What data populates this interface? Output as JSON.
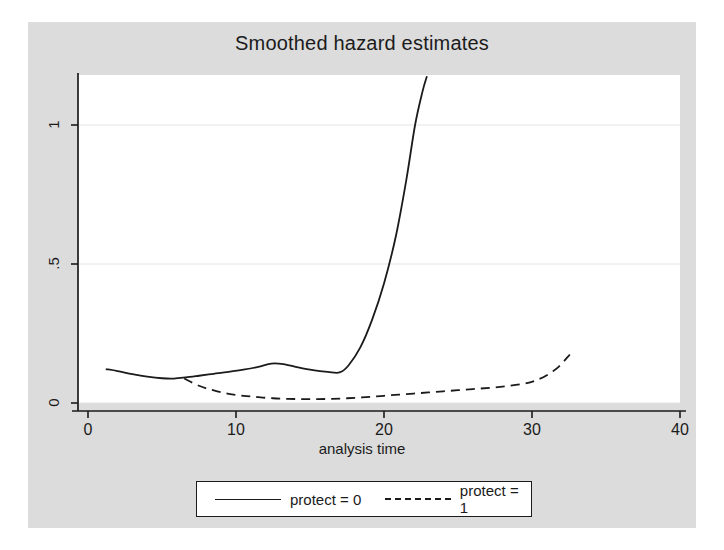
{
  "chart_data": {
    "type": "line",
    "title": "Smoothed hazard estimates",
    "xlabel": "analysis time",
    "ylabel": "",
    "xlim": [
      0,
      40
    ],
    "ylim": [
      0,
      1.22
    ],
    "xticks": [
      "0",
      "10",
      "20",
      "30",
      "40"
    ],
    "xtick_values": [
      0,
      10,
      20,
      30,
      40
    ],
    "yticks": [
      "0",
      ".5",
      "1"
    ],
    "ytick_values": [
      0,
      0.5,
      1
    ],
    "grid": "horizontal",
    "legend_position": "below-axes",
    "series": [
      {
        "name": "protect = 0",
        "style": "solid",
        "color": "#1b1b1b",
        "x": [
          1.2,
          2.0,
          3.0,
          4.0,
          5.0,
          5.8,
          6.6,
          7.5,
          8.5,
          9.5,
          10.5,
          11.5,
          12.4,
          13.2,
          14.2,
          15.2,
          16.2,
          17.0,
          17.6,
          18.4,
          19.2,
          20.0,
          20.8,
          21.5,
          22.1,
          22.6,
          22.9
        ],
        "y": [
          0.122,
          0.115,
          0.104,
          0.095,
          0.089,
          0.088,
          0.092,
          0.098,
          0.105,
          0.112,
          0.12,
          0.13,
          0.142,
          0.14,
          0.128,
          0.118,
          0.112,
          0.11,
          0.135,
          0.2,
          0.3,
          0.43,
          0.6,
          0.8,
          1.0,
          1.12,
          1.175
        ]
      },
      {
        "name": "protect = 1",
        "style": "dashed",
        "color": "#1b1b1b",
        "x": [
          6.5,
          7.5,
          8.5,
          9.5,
          10.5,
          11.5,
          12.5,
          13.5,
          14.5,
          15.5,
          16.5,
          17.5,
          18.5,
          19.5,
          20.5,
          21.5,
          22.5,
          23.5,
          24.5,
          25.5,
          26.5,
          27.5,
          28.5,
          29.5,
          30.2,
          31.0,
          31.8,
          32.4,
          32.8
        ],
        "y": [
          0.088,
          0.062,
          0.045,
          0.033,
          0.026,
          0.021,
          0.017,
          0.015,
          0.014,
          0.014,
          0.015,
          0.017,
          0.02,
          0.024,
          0.028,
          0.032,
          0.036,
          0.04,
          0.044,
          0.048,
          0.052,
          0.056,
          0.062,
          0.07,
          0.08,
          0.1,
          0.13,
          0.165,
          0.19
        ]
      }
    ]
  },
  "legend": {
    "items": [
      {
        "label": "protect = 0",
        "style": "solid"
      },
      {
        "label": "protect = 1",
        "style": "dashed"
      }
    ]
  },
  "colors": {
    "figure_background": "#dcdcdc",
    "plot_background": "#ffffff",
    "axis": "#1b1b1b",
    "grid": "#e4e4e4",
    "text": "#1b1b1b"
  }
}
